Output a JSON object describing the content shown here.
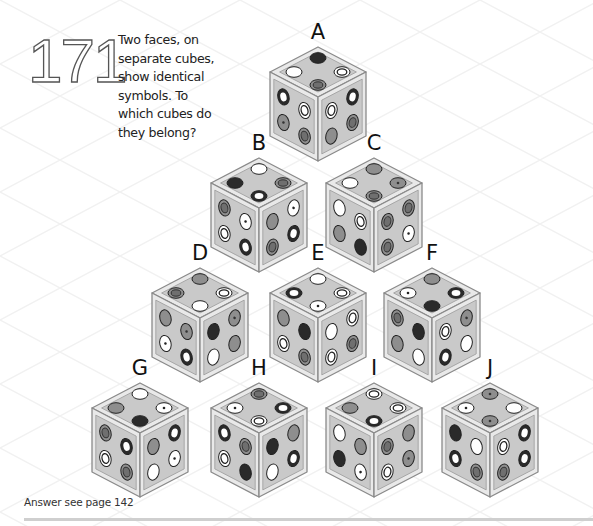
{
  "puzzle": {
    "number": "171",
    "question_lines": [
      "Two faces, on",
      "separate cubes,",
      "show identical",
      "symbols. To",
      "which cubes do",
      "they belong?"
    ],
    "answer_note": "Answer see page 142"
  },
  "colors": {
    "cube_frame": "#e9e9e9",
    "cube_edge": "#8a8a8a",
    "face_fill": "#c9c9c9",
    "symbol_black": "#2a2a2a",
    "symbol_grey": "#8e8e8e",
    "symbol_white": "#ffffff",
    "footer_rule": "#cfcfcf"
  },
  "cubes": [
    {
      "label": "A",
      "cx": 318,
      "ty": 47,
      "top": [
        "black",
        "white",
        "target",
        "grey-target"
      ],
      "left": [
        "ring",
        "target",
        "grey-dot",
        "grey-target"
      ],
      "right": [
        "target",
        "ring",
        "grey",
        "grey-target"
      ]
    },
    {
      "label": "B",
      "cx": 259,
      "ty": 158,
      "top": [
        "white",
        "black",
        "grey-target",
        "ring"
      ],
      "left": [
        "grey-target",
        "dot",
        "target",
        "ring"
      ],
      "right": [
        "grey",
        "dot",
        "grey-target",
        "ring"
      ]
    },
    {
      "label": "C",
      "cx": 374,
      "ty": 158,
      "top": [
        "grey",
        "white",
        "grey-dot",
        "grey-target"
      ],
      "left": [
        "white",
        "target",
        "grey",
        "black"
      ],
      "right": [
        "grey-target",
        "grey-target",
        "grey-target",
        "dot"
      ]
    },
    {
      "label": "D",
      "cx": 200,
      "ty": 268,
      "top": [
        "grey",
        "grey-target",
        "target",
        "white"
      ],
      "left": [
        "grey",
        "grey-dot",
        "dot",
        "ring"
      ],
      "right": [
        "black",
        "grey-dot",
        "white",
        "grey"
      ]
    },
    {
      "label": "E",
      "cx": 318,
      "ty": 268,
      "top": [
        "white",
        "ring",
        "target",
        "dot"
      ],
      "left": [
        "grey",
        "black",
        "target",
        "grey-target"
      ],
      "right": [
        "white",
        "target",
        "target",
        "grey-target"
      ]
    },
    {
      "label": "F",
      "cx": 432,
      "ty": 268,
      "top": [
        "grey",
        "dot",
        "ring",
        "black"
      ],
      "left": [
        "grey-target",
        "black",
        "grey",
        "white"
      ],
      "right": [
        "target",
        "grey-dot",
        "ring",
        "white"
      ]
    },
    {
      "label": "G",
      "cx": 140,
      "ty": 383,
      "top": [
        "white",
        "grey",
        "dot",
        "black"
      ],
      "left": [
        "grey-target",
        "ring",
        "target",
        "grey-target"
      ],
      "right": [
        "grey",
        "ring",
        "white",
        "dot"
      ]
    },
    {
      "label": "H",
      "cx": 259,
      "ty": 383,
      "top": [
        "grey-target",
        "dot",
        "ring",
        "target"
      ],
      "left": [
        "ring",
        "grey-target",
        "target",
        "black"
      ],
      "right": [
        "black",
        "grey",
        "white",
        "ring"
      ]
    },
    {
      "label": "I",
      "cx": 374,
      "ty": 383,
      "top": [
        "target",
        "grey",
        "target",
        "ring"
      ],
      "left": [
        "white",
        "grey",
        "black",
        "dot"
      ],
      "right": [
        "grey-target",
        "grey",
        "target",
        "grey-dot"
      ]
    },
    {
      "label": "J",
      "cx": 490,
      "ty": 383,
      "top": [
        "grey-dot",
        "dot",
        "white",
        "grey-dot"
      ],
      "left": [
        "black",
        "white",
        "ring",
        "grey-target"
      ],
      "right": [
        "target",
        "ring",
        "grey-target",
        "ring"
      ]
    }
  ]
}
